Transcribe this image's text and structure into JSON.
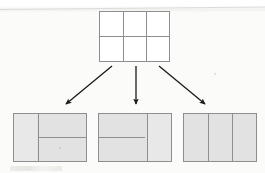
{
  "figure": {
    "kind": "geometry-partition-diagram",
    "colors": {
      "stroke": "#8e8e90",
      "shaded_fill": "#e2e2e2",
      "white_fill": "#ffffff",
      "arrow": "#1a1a1a",
      "page_background": "#fbfbfa"
    },
    "source": {
      "label": "top-grid",
      "fill": "white",
      "columns": 3,
      "rows": 2,
      "cells": 6,
      "bounds": {
        "x": 99,
        "y": 11,
        "width": 71,
        "height": 51
      },
      "vertical_dividers": [
        0.3333,
        0.6667
      ],
      "horizontal_dividers": [
        0.5
      ]
    },
    "arrows": [
      {
        "name": "arrow-left",
        "direction": "down-left",
        "from": {
          "x": 111,
          "y": 66
        },
        "to": {
          "x": 64,
          "y": 105
        },
        "target": "variant-1"
      },
      {
        "name": "arrow-middle",
        "direction": "down",
        "from": {
          "x": 136,
          "y": 66
        },
        "to": {
          "x": 136,
          "y": 105
        },
        "target": "variant-2"
      },
      {
        "name": "arrow-right",
        "direction": "down-right",
        "from": {
          "x": 160,
          "y": 66
        },
        "to": {
          "x": 207,
          "y": 105
        },
        "target": "variant-3"
      }
    ],
    "variants": [
      {
        "name": "variant-1",
        "label": "left-variant",
        "fill": "shaded",
        "bounds": {
          "x": 13,
          "y": 113,
          "width": 74,
          "height": 49
        },
        "vertical_dividers": [
          0.3333
        ],
        "regions": 3,
        "partition": "one full-height column on the left; the right portion split into two stacked halves",
        "right_split_at": 0.5
      },
      {
        "name": "variant-2",
        "label": "middle-variant",
        "fill": "shaded",
        "bounds": {
          "x": 98,
          "y": 113,
          "width": 74,
          "height": 49
        },
        "vertical_dividers": [
          0.6667
        ],
        "regions": 3,
        "partition": "one full-height column on the right; the left portion split into two stacked halves",
        "left_split_at": 0.5
      },
      {
        "name": "variant-3",
        "label": "right-variant",
        "fill": "shaded",
        "bounds": {
          "x": 183,
          "y": 113,
          "width": 74,
          "height": 49
        },
        "vertical_dividers": [
          0.3333,
          0.6667
        ],
        "regions": 3,
        "partition": "three equal full-height vertical columns"
      }
    ]
  }
}
